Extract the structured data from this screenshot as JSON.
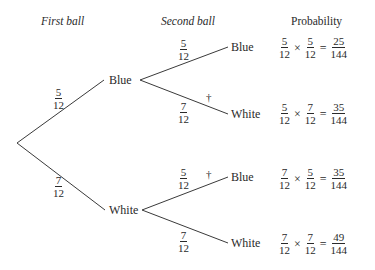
{
  "headers": {
    "first": "First ball",
    "second": "Second ball",
    "probability": "Probability"
  },
  "first_level": {
    "blue": {
      "label": "Blue",
      "prob": {
        "num": "5",
        "den": "12"
      }
    },
    "white": {
      "label": "White",
      "prob": {
        "num": "7",
        "den": "12"
      }
    }
  },
  "second_level": [
    {
      "label": "Blue",
      "prob": {
        "num": "5",
        "den": "12"
      },
      "dagger": false
    },
    {
      "label": "White",
      "prob": {
        "num": "7",
        "den": "12"
      },
      "dagger": true
    },
    {
      "label": "Blue",
      "prob": {
        "num": "5",
        "den": "12"
      },
      "dagger": true
    },
    {
      "label": "White",
      "prob": {
        "num": "7",
        "den": "12"
      },
      "dagger": false
    }
  ],
  "dagger_symbol": "†",
  "operators": {
    "times": "×",
    "equals": "="
  },
  "outcomes": [
    {
      "a": {
        "num": "5",
        "den": "12"
      },
      "b": {
        "num": "5",
        "den": "12"
      },
      "r": {
        "num": "25",
        "den": "144"
      }
    },
    {
      "a": {
        "num": "5",
        "den": "12"
      },
      "b": {
        "num": "7",
        "den": "12"
      },
      "r": {
        "num": "35",
        "den": "144"
      }
    },
    {
      "a": {
        "num": "7",
        "den": "12"
      },
      "b": {
        "num": "5",
        "den": "12"
      },
      "r": {
        "num": "35",
        "den": "144"
      }
    },
    {
      "a": {
        "num": "7",
        "den": "12"
      },
      "b": {
        "num": "7",
        "den": "12"
      },
      "r": {
        "num": "49",
        "den": "144"
      }
    }
  ]
}
